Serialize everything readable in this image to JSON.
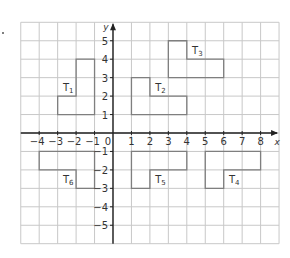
{
  "diagram": {
    "type": "coordinate-grid",
    "x_range": [
      -5,
      9
    ],
    "y_range": [
      -6,
      6
    ],
    "axis_labels": {
      "x": "x",
      "y": "y"
    },
    "origin_label": "0",
    "x_ticks": [
      "-4",
      "-3",
      "-2",
      "-1",
      "1",
      "2",
      "3",
      "4",
      "5",
      "6",
      "7",
      "8"
    ],
    "y_ticks": [
      "5",
      "4",
      "3",
      "2",
      "1",
      "-1",
      "-2",
      "-3",
      "-4",
      "-5"
    ],
    "colors": {
      "grid": "#c8c8c8",
      "shape": "#7f7f7f",
      "axis": "#222222",
      "text": "#333333"
    },
    "shapes": [
      {
        "label": "T",
        "sub": "1",
        "points": [
          [
            -3,
            1
          ],
          [
            -1,
            1
          ],
          [
            -1,
            4
          ],
          [
            -2,
            4
          ],
          [
            -2,
            2
          ],
          [
            -3,
            2
          ]
        ],
        "label_at": [
          -2.5,
          2.5
        ]
      },
      {
        "label": "T",
        "sub": "2",
        "points": [
          [
            1,
            1
          ],
          [
            4,
            1
          ],
          [
            4,
            2
          ],
          [
            2,
            2
          ],
          [
            2,
            3
          ],
          [
            1,
            3
          ]
        ],
        "label_at": [
          2.5,
          2.5
        ]
      },
      {
        "label": "T",
        "sub": "3",
        "points": [
          [
            3,
            3
          ],
          [
            6,
            3
          ],
          [
            6,
            4
          ],
          [
            4,
            4
          ],
          [
            4,
            5
          ],
          [
            3,
            5
          ]
        ],
        "label_at": [
          4.5,
          4.5
        ]
      },
      {
        "label": "T",
        "sub": "4",
        "points": [
          [
            5,
            -1
          ],
          [
            8,
            -1
          ],
          [
            8,
            -2
          ],
          [
            6,
            -2
          ],
          [
            6,
            -3
          ],
          [
            5,
            -3
          ]
        ],
        "label_at": [
          6.5,
          -2.5
        ]
      },
      {
        "label": "T",
        "sub": "5",
        "points": [
          [
            1,
            -1
          ],
          [
            4,
            -1
          ],
          [
            4,
            -2
          ],
          [
            2,
            -2
          ],
          [
            2,
            -3
          ],
          [
            1,
            -3
          ]
        ],
        "label_at": [
          2.5,
          -2.5
        ]
      },
      {
        "label": "T",
        "sub": "6",
        "points": [
          [
            -4,
            -1
          ],
          [
            -1,
            -1
          ],
          [
            -1,
            -3
          ],
          [
            -2,
            -3
          ],
          [
            -2,
            -2
          ],
          [
            -4,
            -2
          ]
        ],
        "label_at": [
          -2.5,
          -2.5
        ]
      }
    ]
  }
}
